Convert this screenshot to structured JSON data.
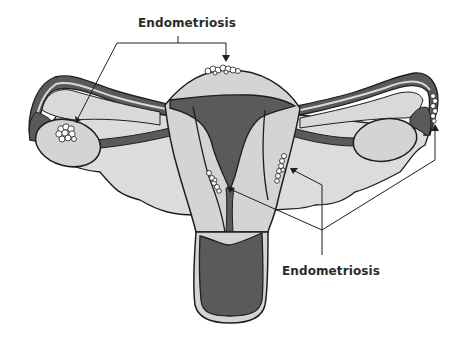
{
  "diagram": {
    "labels": {
      "top": "Endometriosis",
      "bottom": "Endometriosis"
    },
    "colors": {
      "outline": "#1e1e1e",
      "tissue_light": "#d9d9d9",
      "tissue_dark": "#5a5a5a",
      "implant": "#ffffff",
      "background": "#ffffff",
      "text": "#2a2a2a"
    },
    "structures": [
      "uterus-fundus",
      "uterine-cavity",
      "cervix",
      "vagina",
      "left-fallopian-tube",
      "right-fallopian-tube",
      "left-ovary",
      "right-ovary",
      "broad-ligament"
    ],
    "endometriosis_sites": [
      "uterine-fundus-top",
      "left-ovary",
      "right-fimbriae",
      "uterine-wall-left",
      "uterine-wall-right"
    ]
  }
}
